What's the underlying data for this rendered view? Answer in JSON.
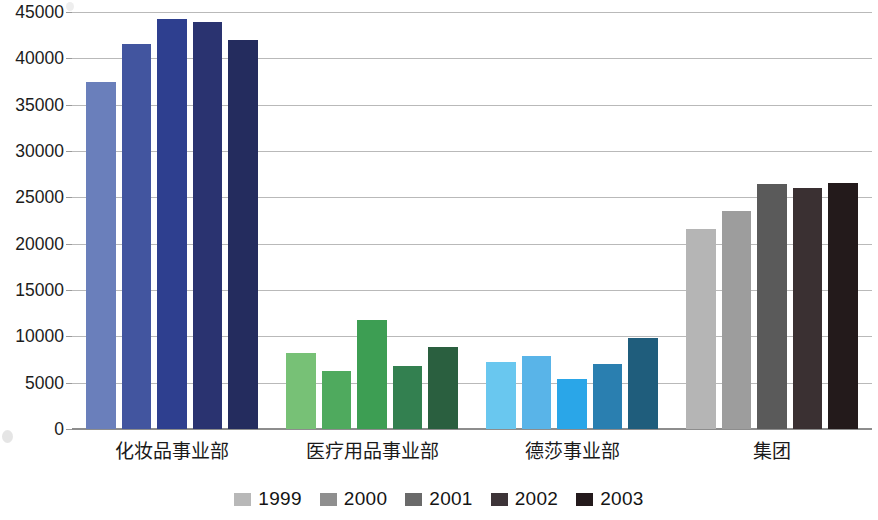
{
  "chart_data": {
    "type": "bar",
    "title": "",
    "subtitle": "",
    "xlabel": "",
    "ylabel": "",
    "ylim": [
      0,
      45000
    ],
    "ytick_step": 5000,
    "grid": true,
    "legend_position": "bottom",
    "categories": [
      "化妆品事业部",
      "医疗用品事业部",
      "德莎事业部",
      "集团"
    ],
    "ytick_labels": [
      "45000",
      "40000",
      "35000",
      "30000",
      "25000",
      "20000",
      "15000",
      "10000",
      "5000",
      "0"
    ],
    "ytick_values": [
      45000,
      40000,
      35000,
      30000,
      25000,
      20000,
      15000,
      10000,
      5000,
      0
    ],
    "series": [
      {
        "name": "1999",
        "values": [
          37400,
          8200,
          7200,
          21600
        ]
      },
      {
        "name": "2000",
        "values": [
          41600,
          6300,
          7900,
          23500
        ]
      },
      {
        "name": "2001",
        "values": [
          44200,
          11800,
          5400,
          26400
        ]
      },
      {
        "name": "2002",
        "values": [
          43900,
          6800,
          7000,
          26000
        ]
      },
      {
        "name": "2003",
        "values": [
          42000,
          8900,
          9800,
          26600
        ]
      }
    ],
    "legend_swatch_colors": [
      "#b8b8b8",
      "#8f8f8f",
      "#6a6a6a",
      "#3d3438",
      "#241a1c"
    ],
    "group_colors": [
      [
        "#6a7fbb",
        "#42559f",
        "#2e3f8f",
        "#2a3370",
        "#242c5e"
      ],
      [
        "#77c176",
        "#4faa5e",
        "#3d9e53",
        "#338050",
        "#2a5f3f"
      ],
      [
        "#69c7ef",
        "#59b4e8",
        "#2aa6e8",
        "#2a7fb0",
        "#1f5d7c"
      ],
      [
        "#b5b5b5",
        "#9d9d9d",
        "#5a5a5a",
        "#3a3032",
        "#231a1b"
      ]
    ]
  },
  "legend": {
    "entries": [
      {
        "label": "1999"
      },
      {
        "label": "2000"
      },
      {
        "label": "2001"
      },
      {
        "label": "2002"
      },
      {
        "label": "2003"
      }
    ]
  }
}
